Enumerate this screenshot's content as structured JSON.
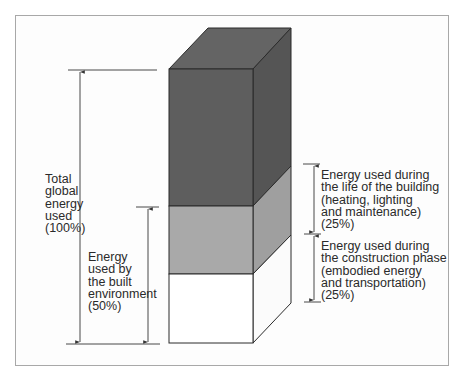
{
  "diagram": {
    "type": "stacked-3d-column",
    "colors": {
      "frame": "#a8a8a8",
      "outline": "#2b2b2b",
      "dark_front": "#5e5e5e",
      "dark_top": "#646464",
      "dark_side": "#555555",
      "mid_front": "#a9a9a9",
      "mid_side": "#9f9f9f",
      "light_front": "#ffffff",
      "light_side": "#fbfbfb",
      "arrow": "#333333"
    },
    "segments": [
      {
        "name": "other-global-energy",
        "share": 50
      },
      {
        "name": "energy-during-life-of-building",
        "share": 25
      },
      {
        "name": "energy-during-construction",
        "share": 25
      }
    ],
    "labels": {
      "total": "Total\nglobal\nenergy\nused\n(100%)",
      "built_env": "Energy\nused by\nthe built\nenvironment\n(50%)",
      "life": "Energy used during\nthe life of the building\n(heating, lighting\nand maintenance)\n(25%)",
      "construction": "Energy used during\nthe construction phase\n(embodied energy\nand transportation)\n(25%)"
    }
  }
}
